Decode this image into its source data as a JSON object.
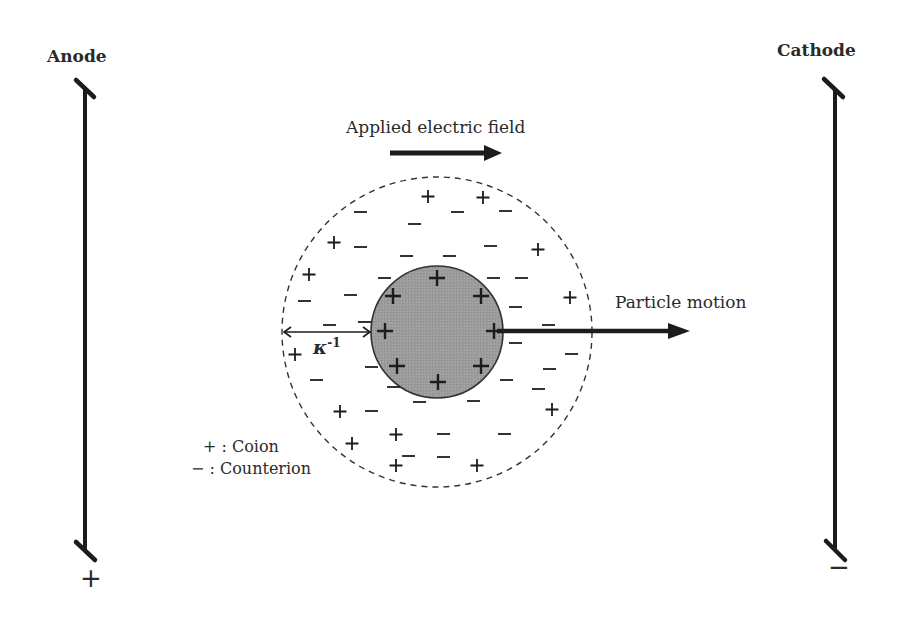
{
  "electrodes": {
    "anode": {
      "label": "Anode",
      "polarity": "+"
    },
    "cathode": {
      "label": "Cathode",
      "polarity": "−"
    }
  },
  "field": {
    "label": "Applied electric field",
    "direction": "right"
  },
  "motion": {
    "label": "Particle motion",
    "direction": "right"
  },
  "debye_length": {
    "symbol": "κ",
    "exponent": "-1"
  },
  "legend": {
    "coion": "+ : Coion",
    "counterion": "− : Counterion"
  },
  "particle": {
    "fill": "#9a9a9a",
    "surface_charge": "+",
    "surface_charge_count": 8
  },
  "double_layer": {
    "boundary": "dashed",
    "coions": 13,
    "counterions": 33
  },
  "colors": {
    "line": "#1c1c1c",
    "particle_fill": "#9a9a9a",
    "text": "#2a2a2a"
  }
}
